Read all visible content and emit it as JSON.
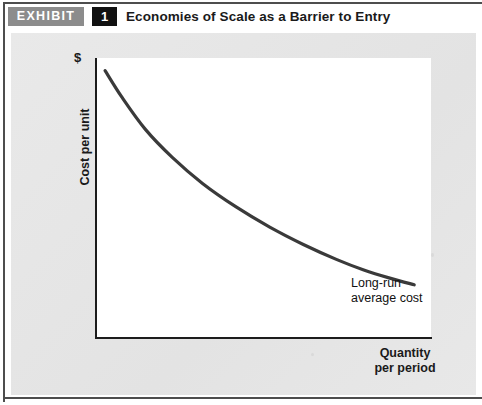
{
  "header": {
    "tag_label": "EXHIBIT",
    "number": "1",
    "title": "Economies of Scale as a Barrier to Entry"
  },
  "colors": {
    "tag_background": "#8c8c8c",
    "number_background": "#111111",
    "panel_background": "#e6e6e6",
    "plot_background": "#ffffff",
    "axis": "#1c1c1c",
    "curve": "#3a3a3a",
    "text": "#1a1a1a"
  },
  "chart_data": {
    "type": "line",
    "title": "Economies of Scale as a Barrier to Entry",
    "xlabel": "Quantity per period",
    "ylabel": "Cost per unit",
    "y_axis_unit_label": "$",
    "grid": false,
    "legend": "inline-annotation",
    "annotations": [
      {
        "text": "Long-run average cost",
        "lines": [
          "Long-run",
          "average cost"
        ],
        "attached_to": "lrac-curve",
        "position": "end-of-curve-right"
      }
    ],
    "series": [
      {
        "name": "Long-run average cost",
        "color": "#3a3a3a",
        "x": [
          0.03,
          0.08,
          0.15,
          0.23,
          0.32,
          0.42,
          0.52,
          0.62,
          0.72,
          0.8,
          0.88,
          0.95
        ],
        "y": [
          0.955,
          0.86,
          0.745,
          0.645,
          0.552,
          0.468,
          0.396,
          0.334,
          0.28,
          0.243,
          0.213,
          0.19
        ]
      }
    ],
    "xlim": [
      0,
      1
    ],
    "ylim": [
      0,
      1
    ],
    "x_tick_labels": [],
    "y_tick_labels": []
  },
  "labels": {
    "dollar": "$",
    "y_axis": "Cost per unit",
    "x_axis_line1": "Quantity",
    "x_axis_line2": "per period",
    "curve_line1": "Long-run",
    "curve_line2": "average cost"
  }
}
